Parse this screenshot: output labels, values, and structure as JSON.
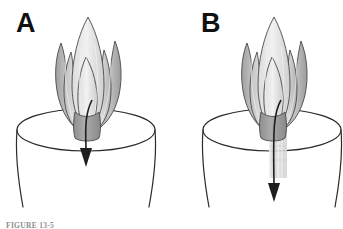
{
  "figure": {
    "caption": "FIGURE 13-5",
    "background_color": "#ffffff",
    "width": 343,
    "height": 229
  },
  "panels": [
    {
      "letter": "A",
      "name": "panel-a-native-valve",
      "letter_x": 16,
      "letter_y": 10,
      "origin_x": 0,
      "container": {
        "name": "cylinder-vessel",
        "rim_cx": 86,
        "rim_cy": 130,
        "rim_rx": 69,
        "rim_ry": 21,
        "wall_bottom_y": 207,
        "wall_left_bottom_x": 23,
        "wall_right_bottom_x": 149,
        "stroke_color": "#2b2b2b",
        "stroke_width": 1.2
      },
      "leaflets": {
        "name": "valve-leaflet-cluster",
        "count": 5,
        "apex_y": 16,
        "base_y": 130,
        "fill_light": "#ececec",
        "fill_mid": "#c9c9c9",
        "fill_dark": "#a8a8a8",
        "stem_fill": "#9a9a9a",
        "outline_color": "#4a4a4a"
      },
      "arrow": {
        "name": "flow-arrow",
        "start_x": 88,
        "start_y": 100,
        "end_y": 165,
        "color": "#1e1e1e",
        "shaft_width": 1.6,
        "head_width": 13,
        "head_length": 18,
        "curved": true
      },
      "stent": null
    },
    {
      "letter": "B",
      "name": "panel-b-stented-valve",
      "letter_x": 201,
      "letter_y": 10,
      "origin_x": 186,
      "container": {
        "name": "cylinder-vessel",
        "rim_cx": 272,
        "rim_cy": 130,
        "rim_rx": 69,
        "rim_ry": 21,
        "wall_bottom_y": 207,
        "wall_left_bottom_x": 209,
        "wall_right_bottom_x": 335,
        "stroke_color": "#2b2b2b",
        "stroke_width": 1.2
      },
      "leaflets": {
        "name": "valve-leaflet-cluster",
        "count": 5,
        "apex_y": 16,
        "base_y": 130,
        "fill_light": "#ececec",
        "fill_mid": "#c9c9c9",
        "fill_dark": "#a8a8a8",
        "stem_fill": "#9a9a9a",
        "outline_color": "#4a4a4a"
      },
      "arrow": {
        "name": "flow-arrow",
        "start_x": 277,
        "start_y": 100,
        "end_y": 200,
        "color": "#1e1e1e",
        "shaft_width": 1.6,
        "head_width": 13,
        "head_length": 18,
        "curved": true
      },
      "stent": {
        "name": "stent-sleeve",
        "x": 269,
        "y": 118,
        "width": 18,
        "height": 60,
        "fill": "#e4e4e4",
        "stripe_color": "#cfcfcf",
        "stripe_count": 5,
        "opacity": 0.85
      }
    }
  ]
}
